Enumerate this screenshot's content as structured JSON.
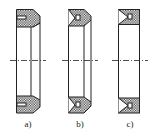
{
  "figure": {
    "type": "seal-cross-sections",
    "stroke_color": "#222222",
    "hatch_color": "#555555",
    "background": "#ffffff"
  },
  "panels": [
    {
      "id": "a",
      "label": "a)"
    },
    {
      "id": "b",
      "label": "b)"
    },
    {
      "id": "c",
      "label": "c)"
    }
  ]
}
